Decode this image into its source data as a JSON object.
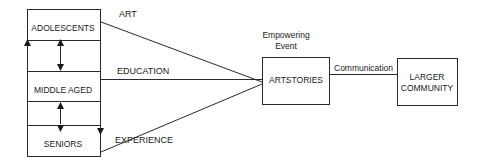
{
  "diagram": {
    "groups": [
      {
        "id": "adolescents",
        "label": "ADOLESCENTS"
      },
      {
        "id": "middle_aged",
        "label": "MIDDLE AGED"
      },
      {
        "id": "seniors",
        "label": "SENIORS"
      }
    ],
    "connectors": [
      {
        "from": "adolescents",
        "label": "ART"
      },
      {
        "from": "middle_aged",
        "label": "EDUCATION"
      },
      {
        "from": "seniors",
        "label": "EXPERIENCE"
      }
    ],
    "event_label_line1": "Empowering",
    "event_label_line2": "Event",
    "center_box": {
      "label": "ARTSTORIES"
    },
    "link_label": "Communication",
    "target_box": {
      "line1": "LARGER",
      "line2": "COMMUNITY"
    },
    "line_color": "#2a2a2a"
  }
}
